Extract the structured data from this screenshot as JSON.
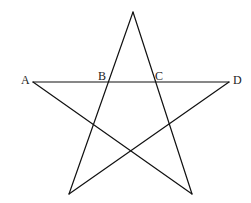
{
  "diagram": {
    "type": "pentagram",
    "stroke_color": "#111111",
    "label_color": "#222222",
    "background": "#ffffff",
    "vertices": {
      "top": {
        "x": 133,
        "y": 12
      },
      "A": {
        "x": 33,
        "y": 82
      },
      "D": {
        "x": 229,
        "y": 82
      },
      "bottom_left": {
        "x": 69,
        "y": 194
      },
      "bottom_right": {
        "x": 192,
        "y": 194
      }
    },
    "points": [
      {
        "name": "A",
        "label": "A",
        "x": 21,
        "y": 84
      },
      {
        "name": "B",
        "label": "B",
        "x": 98,
        "y": 80
      },
      {
        "name": "C",
        "label": "C",
        "x": 155,
        "y": 80
      },
      {
        "name": "D",
        "label": "D",
        "x": 233,
        "y": 84
      }
    ],
    "edges": [
      {
        "from": "A",
        "to": "D"
      },
      {
        "from": "A",
        "to": "bottom_right"
      },
      {
        "from": "D",
        "to": "bottom_left"
      },
      {
        "from": "top",
        "to": "bottom_left"
      },
      {
        "from": "top",
        "to": "bottom_right"
      }
    ]
  }
}
